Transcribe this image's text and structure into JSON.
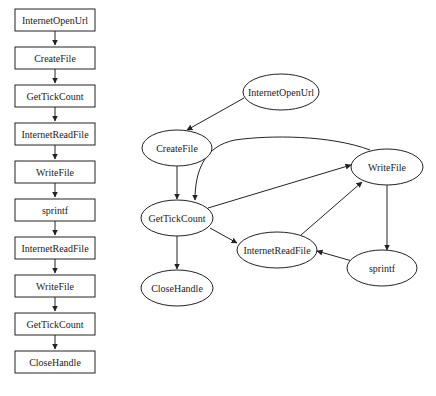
{
  "sequence": {
    "nodes": [
      "InternetOpenUrl",
      "CreateFile",
      "GetTickCount",
      "InternetReadFile",
      "WriteFile",
      "sprintf",
      "InternetReadFile",
      "WriteFile",
      "GetTickCount",
      "CloseHandle"
    ]
  },
  "graph": {
    "nodes": {
      "internetopenurl": "InternetOpenUrl",
      "createfile": "CreateFile",
      "writefile": "WriteFile",
      "gettickcount": "GetTickCount",
      "internetreadfile": "InternetReadFile",
      "sprintf": "sprintf",
      "closehandle": "CloseHandle"
    },
    "edges": [
      [
        "InternetOpenUrl",
        "CreateFile"
      ],
      [
        "CreateFile",
        "GetTickCount"
      ],
      [
        "GetTickCount",
        "WriteFile"
      ],
      [
        "WriteFile",
        "GetTickCount"
      ],
      [
        "GetTickCount",
        "InternetReadFile"
      ],
      [
        "GetTickCount",
        "CloseHandle"
      ],
      [
        "InternetReadFile",
        "WriteFile"
      ],
      [
        "WriteFile",
        "sprintf"
      ],
      [
        "sprintf",
        "InternetReadFile"
      ]
    ]
  },
  "colors": {
    "stroke": "#222222",
    "background": "#ffffff"
  }
}
